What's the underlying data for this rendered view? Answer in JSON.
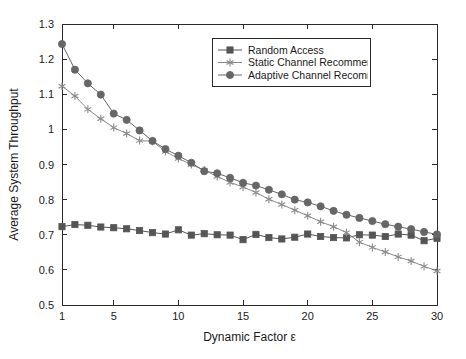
{
  "chart_data": {
    "type": "line",
    "title": "",
    "xlabel": "Dynamic Factor ε",
    "ylabel": "Average System Throughput",
    "xlim": [
      1,
      30
    ],
    "ylim": [
      0.5,
      1.3
    ],
    "xticks": [
      1,
      5,
      10,
      15,
      20,
      25,
      30
    ],
    "xtick_labels": [
      "1",
      "5",
      "10",
      "15",
      "20",
      "25",
      "30"
    ],
    "yticks": [
      0.5,
      0.6,
      0.7,
      0.8,
      0.9,
      1.0,
      1.1,
      1.2,
      1.3
    ],
    "ytick_labels": [
      "0.5",
      "0.6",
      "0.7",
      "0.8",
      "0.9",
      "1",
      "1.1",
      "1.2",
      "1.3"
    ],
    "grid": false,
    "legend_position": "top-right",
    "x": [
      1,
      2,
      3,
      4,
      5,
      6,
      7,
      8,
      9,
      10,
      11,
      12,
      13,
      14,
      15,
      16,
      17,
      18,
      19,
      20,
      21,
      22,
      23,
      24,
      25,
      26,
      27,
      28,
      29,
      30
    ],
    "series": [
      {
        "name": "Random Access",
        "marker": "square",
        "color": "#555555",
        "values": [
          0.723,
          0.729,
          0.727,
          0.722,
          0.72,
          0.717,
          0.712,
          0.706,
          0.702,
          0.714,
          0.699,
          0.703,
          0.7,
          0.699,
          0.686,
          0.701,
          0.692,
          0.688,
          0.693,
          0.702,
          0.695,
          0.692,
          0.691,
          0.7,
          0.699,
          0.695,
          0.702,
          0.699,
          0.683,
          0.69
        ]
      },
      {
        "name": "Static Channel Recommendation",
        "marker": "asterisk",
        "color": "#8a8a8a",
        "values": [
          1.123,
          1.095,
          1.057,
          1.03,
          1.005,
          0.988,
          0.968,
          0.966,
          0.937,
          0.917,
          0.9,
          0.884,
          0.866,
          0.849,
          0.836,
          0.82,
          0.801,
          0.786,
          0.77,
          0.754,
          0.737,
          0.723,
          0.706,
          0.679,
          0.664,
          0.651,
          0.637,
          0.625,
          0.61,
          0.597
        ]
      },
      {
        "name": "Adaptive Channel Recommendatio",
        "marker": "circle",
        "color": "#666666",
        "values": [
          1.243,
          1.17,
          1.131,
          1.099,
          1.045,
          1.027,
          0.997,
          0.967,
          0.944,
          0.925,
          0.905,
          0.881,
          0.875,
          0.862,
          0.848,
          0.84,
          0.828,
          0.815,
          0.8,
          0.792,
          0.781,
          0.768,
          0.757,
          0.748,
          0.739,
          0.73,
          0.723,
          0.716,
          0.708,
          0.701
        ]
      }
    ]
  },
  "legend": {
    "entries": [
      {
        "label": "Random Access"
      },
      {
        "label": "Static Channel Recommendation"
      },
      {
        "label": "Adaptive Channel Recommendatio"
      }
    ]
  }
}
